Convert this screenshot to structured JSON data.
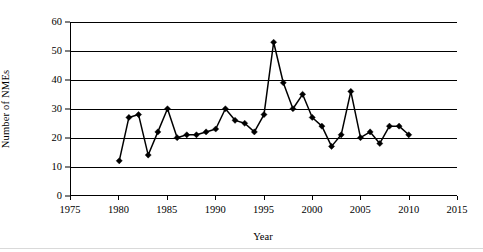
{
  "chart_data": {
    "type": "line",
    "title": "",
    "subtitle": "",
    "xlabel": "Year",
    "ylabel": "Number of NMEs",
    "xlim": [
      1975,
      2015
    ],
    "ylim": [
      0,
      60
    ],
    "xticks": [
      1975,
      1980,
      1985,
      1990,
      1995,
      2000,
      2005,
      2010,
      2015
    ],
    "yticks": [
      0,
      10,
      20,
      30,
      40,
      50,
      60
    ],
    "grid": "horizontal",
    "legend": "none",
    "marker": "filled-diamond",
    "line_color": "#000000",
    "marker_color": "#000000",
    "series": [
      {
        "name": "NMEs",
        "x": [
          1980,
          1981,
          1982,
          1983,
          1984,
          1985,
          1986,
          1987,
          1988,
          1989,
          1990,
          1991,
          1992,
          1993,
          1994,
          1995,
          1996,
          1997,
          1998,
          1999,
          2000,
          2001,
          2002,
          2003,
          2004,
          2005,
          2006,
          2007,
          2008,
          2009,
          2010
        ],
        "values": [
          12,
          27,
          28,
          14,
          22,
          30,
          20,
          21,
          21,
          22,
          23,
          30,
          26,
          25,
          22,
          28,
          53,
          39,
          30,
          35,
          27,
          24,
          17,
          21,
          36,
          20,
          22,
          18,
          24,
          24,
          21
        ]
      }
    ],
    "annotations": []
  },
  "axis": {
    "y_title": "Number of NMEs",
    "x_title": "Year",
    "y_tick_labels": [
      "0",
      "10",
      "20",
      "30",
      "40",
      "50",
      "60"
    ],
    "x_tick_labels": [
      "1975",
      "1980",
      "1985",
      "1990",
      "1995",
      "2000",
      "2005",
      "2010",
      "2015"
    ]
  }
}
